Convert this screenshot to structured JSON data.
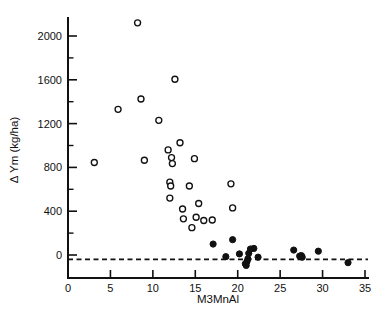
{
  "chart_data": {
    "type": "scatter",
    "title": "",
    "xlabel": "M3MnAl",
    "ylabel": "Δ Ym (kg/ha)",
    "xlim": [
      0,
      35
    ],
    "ylim": [
      -180,
      2200
    ],
    "xticks": [
      0,
      5,
      10,
      15,
      20,
      25,
      30,
      35
    ],
    "xtick_labels": [
      "0",
      "5",
      "10",
      "15",
      "20",
      "25",
      "30",
      "35"
    ],
    "yticks": [
      0,
      400,
      800,
      1200,
      1600,
      2000
    ],
    "ytick_labels": [
      "0",
      "400",
      "800",
      "1200",
      "1600",
      "2000"
    ],
    "y_minor_ticks": [
      200,
      600,
      1000,
      1400,
      1800,
      2200
    ],
    "grid": false,
    "legend": "none",
    "annotations": [
      {
        "type": "hline",
        "y": -40,
        "style": "dashed",
        "label": "zero reference line"
      }
    ],
    "series": [
      {
        "name": "open-circles",
        "marker": "open-circle",
        "points": [
          [
            3.1,
            845
          ],
          [
            5.9,
            1330
          ],
          [
            8.2,
            2120
          ],
          [
            8.6,
            1425
          ],
          [
            9.0,
            865
          ],
          [
            10.7,
            1230
          ],
          [
            11.8,
            960
          ],
          [
            12.2,
            890
          ],
          [
            12.0,
            665
          ],
          [
            12.1,
            630
          ],
          [
            12.3,
            835
          ],
          [
            12.0,
            520
          ],
          [
            12.6,
            1605
          ],
          [
            13.2,
            1025
          ],
          [
            13.5,
            420
          ],
          [
            13.6,
            330
          ],
          [
            14.3,
            630
          ],
          [
            14.6,
            250
          ],
          [
            14.9,
            880
          ],
          [
            15.1,
            345
          ],
          [
            15.4,
            470
          ],
          [
            16.0,
            315
          ],
          [
            17.0,
            320
          ],
          [
            19.2,
            650
          ],
          [
            19.4,
            430
          ]
        ]
      },
      {
        "name": "filled-circles",
        "marker": "filled-circle",
        "points": [
          [
            17.1,
            100
          ],
          [
            18.6,
            -15
          ],
          [
            19.4,
            140
          ],
          [
            20.2,
            10
          ],
          [
            20.9,
            -80
          ],
          [
            21.0,
            -95
          ],
          [
            21.1,
            -60
          ],
          [
            21.2,
            -35
          ],
          [
            21.3,
            15
          ],
          [
            21.5,
            55
          ],
          [
            21.9,
            60
          ],
          [
            22.4,
            -20
          ],
          [
            26.6,
            45
          ],
          [
            27.3,
            -10
          ],
          [
            27.5,
            -5
          ],
          [
            27.6,
            -20
          ],
          [
            29.5,
            35
          ],
          [
            33.0,
            -70
          ]
        ]
      }
    ]
  },
  "axes": {
    "x_axis_name": "M3MnAl",
    "y_axis_name": "Δ Ym (kg/ha)"
  }
}
